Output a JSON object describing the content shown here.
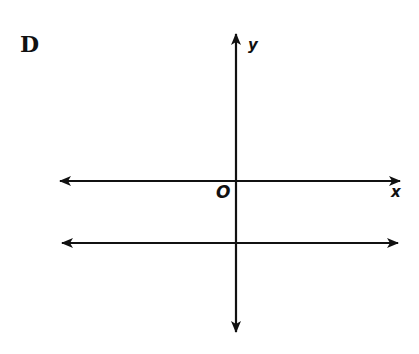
{
  "choice_label": "D",
  "axes": {
    "x_label": "x",
    "y_label": "y",
    "origin_label": "O"
  },
  "figure": {
    "lines": [
      {
        "name": "x-axis",
        "orientation": "horizontal",
        "arrows": "both"
      },
      {
        "name": "y-axis",
        "orientation": "vertical",
        "arrows": "both"
      },
      {
        "name": "parallel-line",
        "orientation": "horizontal",
        "position": "below x-axis",
        "arrows": "both"
      }
    ],
    "stroke_color": "#111111"
  }
}
